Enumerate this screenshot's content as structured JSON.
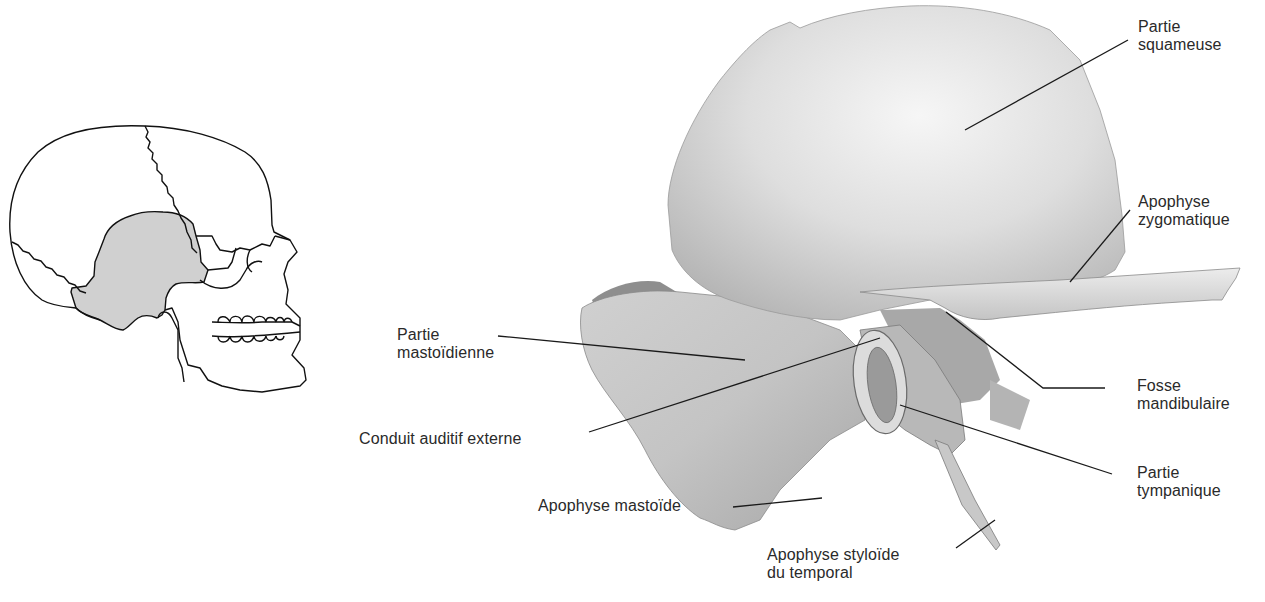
{
  "figure": {
    "colors": {
      "text": "#2a2a2a",
      "leader_line": "#1a1a1a",
      "bone_light": "#f2f2f2",
      "bone_mid": "#d4d4d4",
      "bone_shadow": "#a8a8a8",
      "skull_highlight": "#d0d0d0",
      "outline": "#111111"
    }
  },
  "skull_thumbnail": {
    "highlighted_bone": "temporal"
  },
  "labels": {
    "partie_squameuse": {
      "line1": "Partie",
      "line2": "squameuse"
    },
    "apophyse_zygomatique": {
      "line1": "Apophyse",
      "line2": "zygomatique"
    },
    "fosse_mandibulaire": {
      "line1": "Fosse",
      "line2": "mandibulaire"
    },
    "partie_tympanique": {
      "line1": "Partie",
      "line2": "tympanique"
    },
    "partie_mastoidienne": {
      "line1": "Partie",
      "line2": "mastoïdienne"
    },
    "conduit_auditif_externe": {
      "line1": "Conduit auditif externe"
    },
    "apophyse_mastoide": {
      "line1": "Apophyse mastoïde"
    },
    "apophyse_styloide": {
      "line1": "Apophyse styloïde",
      "line2": "du temporal"
    }
  }
}
